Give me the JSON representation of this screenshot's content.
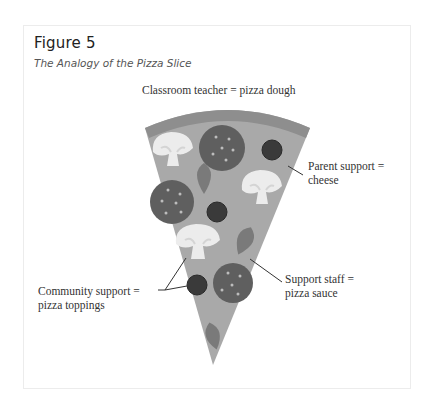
{
  "figure": {
    "number": "Figure 5",
    "title": "The Analogy of the Pizza Slice"
  },
  "labels": {
    "dough": "Classroom teacher = pizza dough",
    "cheese_line1": "Parent support =",
    "cheese_line2": "cheese",
    "toppings_line1": "Community support =",
    "toppings_line2": "pizza toppings",
    "sauce_line1": "Support staff =",
    "sauce_line2": "pizza sauce"
  },
  "colors": {
    "crust": "#8e8e8e",
    "cheese": "#a9a9a9",
    "pepperoni": "#5f5f5f",
    "olive": "#3a3a3a",
    "leaf": "#7a7a7a",
    "mushroom": "#ececec"
  }
}
